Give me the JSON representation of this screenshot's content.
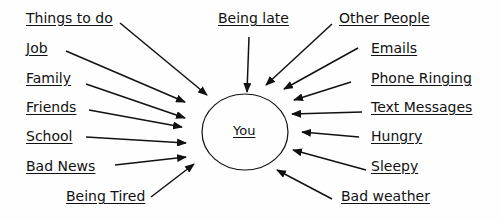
{
  "diagram": {
    "center": {
      "label": "You",
      "cx": 245,
      "cy": 132,
      "rx": 43,
      "ry": 38
    },
    "colors": {
      "stroke": "#111111",
      "text": "#111111",
      "background": "#fefefe"
    },
    "stressors": [
      {
        "id": "things-to-do",
        "label": "Things to do",
        "x": 26,
        "y": 10,
        "arrow": [
          120,
          23,
          207,
          95
        ]
      },
      {
        "id": "job",
        "label": "Job",
        "x": 26,
        "y": 40,
        "arrow": [
          66,
          51,
          185,
          102
        ]
      },
      {
        "id": "family",
        "label": "Family",
        "x": 26,
        "y": 70,
        "arrow": [
          86,
          84,
          185,
          118
        ]
      },
      {
        "id": "friends",
        "label": "Friends",
        "x": 26,
        "y": 99,
        "arrow": [
          89,
          110,
          182,
          127
        ]
      },
      {
        "id": "school",
        "label": "School",
        "x": 26,
        "y": 128,
        "arrow": [
          86,
          137,
          186,
          143
        ]
      },
      {
        "id": "bad-news",
        "label": "Bad News",
        "x": 26,
        "y": 158,
        "arrow": [
          115,
          165,
          186,
          157
        ]
      },
      {
        "id": "being-tired",
        "label": "Being Tired",
        "x": 66,
        "y": 188,
        "arrow": [
          151,
          197,
          194,
          164
        ]
      },
      {
        "id": "being-late",
        "label": "Being late",
        "x": 218,
        "y": 10,
        "arrow": [
          249,
          37,
          247,
          92
        ]
      },
      {
        "id": "other-people",
        "label": "Other People",
        "x": 339,
        "y": 10,
        "arrow": [
          332,
          24,
          266,
          85
        ]
      },
      {
        "id": "emails",
        "label": "Emails",
        "x": 371,
        "y": 40,
        "arrow": [
          358,
          48,
          284,
          89
        ]
      },
      {
        "id": "phone-ringing",
        "label": "Phone Ringing",
        "x": 371,
        "y": 70,
        "arrow": [
          351,
          82,
          294,
          100
        ]
      },
      {
        "id": "text-messages",
        "label": "Text Messages",
        "x": 371,
        "y": 99,
        "arrow": [
          362,
          112,
          292,
          114
        ]
      },
      {
        "id": "hungry",
        "label": "Hungry",
        "x": 371,
        "y": 128,
        "arrow": [
          359,
          137,
          302,
          132
        ]
      },
      {
        "id": "sleepy",
        "label": "Sleepy",
        "x": 371,
        "y": 158,
        "arrow": [
          366,
          170,
          293,
          150
        ]
      },
      {
        "id": "bad-weather",
        "label": "Bad weather",
        "x": 341,
        "y": 188,
        "arrow": [
          332,
          199,
          277,
          170
        ]
      }
    ]
  }
}
